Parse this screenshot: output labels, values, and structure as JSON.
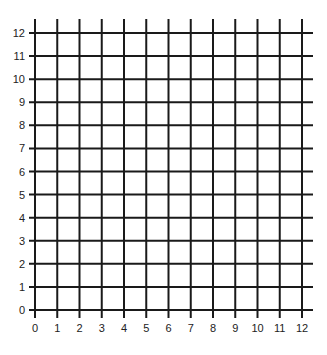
{
  "grid": {
    "type": "coordinate-grid",
    "x_range": [
      0,
      12
    ],
    "y_range": [
      0,
      12
    ],
    "x_tick_labels": [
      "0",
      "1",
      "2",
      "3",
      "4",
      "5",
      "6",
      "7",
      "8",
      "9",
      "10",
      "11",
      "12"
    ],
    "y_tick_labels": [
      "0",
      "1",
      "2",
      "3",
      "4",
      "5",
      "6",
      "7",
      "8",
      "9",
      "10",
      "11",
      "12"
    ],
    "line_color": "#1a1a1a",
    "background": "#ffffff"
  }
}
